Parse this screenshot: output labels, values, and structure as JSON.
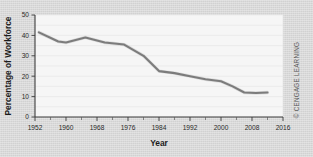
{
  "figure": {
    "background_color": "#d7d7d7",
    "plot_background_color": "#f6f6f6",
    "credit": "© CENGAGE LEARNING"
  },
  "chart_data": {
    "type": "line",
    "title": "",
    "xlabel": "Year",
    "ylabel": "Percentage of Workforce",
    "xlim": [
      1952,
      2016
    ],
    "ylim": [
      0,
      50
    ],
    "grid": true,
    "legend": false,
    "line_color": "#6e6e6e",
    "x_ticks": [
      1952,
      1960,
      1968,
      1976,
      1984,
      1992,
      2000,
      2008,
      2016
    ],
    "x_tick_labels": [
      "1952",
      "1960",
      "1968",
      "1976",
      "1984",
      "1992",
      "2000",
      "2008",
      "2016"
    ],
    "x_minor_ticks": [
      1956,
      1964,
      1972,
      1980,
      1988,
      1996,
      2004,
      2012
    ],
    "y_ticks": [
      0,
      10,
      20,
      30,
      40,
      50
    ],
    "y_tick_labels": [
      "0",
      "10",
      "20",
      "30",
      "40",
      "50"
    ],
    "series": [
      {
        "name": "Union membership",
        "x": [
          1953,
          1958,
          1960,
          1965,
          1970,
          1975,
          1980,
          1984,
          1988,
          1992,
          1996,
          2000,
          2003,
          2006,
          2009,
          2012
        ],
        "values": [
          41.5,
          37.0,
          36.5,
          39.0,
          36.5,
          35.5,
          30.0,
          22.5,
          21.5,
          20.0,
          18.5,
          17.5,
          15.0,
          12.0,
          11.8,
          12.0
        ]
      }
    ]
  }
}
